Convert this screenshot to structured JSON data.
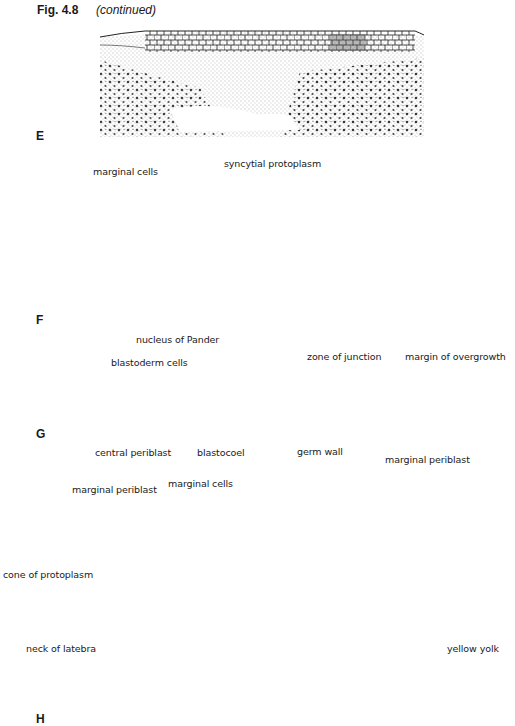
{
  "figure": {
    "number": "Fig. 4.8",
    "note": "(continued)"
  },
  "panels": [
    {
      "letter": "E",
      "labels": []
    },
    {
      "letter": "F",
      "labels": [
        "marginal cells",
        "syncytial protoplasm"
      ]
    },
    {
      "letter": "G",
      "labels": [
        "nucleus of Pander",
        "blastoderm cells",
        "zone of junction",
        "margin of overgrowth",
        "central periblast",
        "blastocoel",
        "germ wall",
        "marginal periblast"
      ]
    },
    {
      "letter": "H",
      "labels": [
        "marginal periblast",
        "marginal cells",
        "cone of protoplasm",
        "neck of latebra",
        "yellow yolk"
      ]
    }
  ],
  "colors": {
    "ink": "#1a1a1a",
    "stipple": "#555555",
    "paper": "#ffffff"
  }
}
